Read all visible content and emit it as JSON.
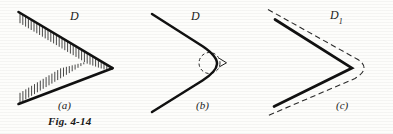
{
  "figure": {
    "caption": "Fig. 4-14",
    "panels": [
      {
        "id": "a",
        "label": "(a)",
        "region_label": "D",
        "description": "wedge domain with hatched boundary"
      },
      {
        "id": "b",
        "label": "(b)",
        "region_label": "D",
        "description": "wedge domain with rounded vertex, dashed circle and arrow"
      },
      {
        "id": "c",
        "label": "(c)",
        "region_label": "D",
        "region_label_subscript": "1",
        "description": "wedge with dashed offset outline"
      }
    ]
  },
  "colors": {
    "ink": "#111111",
    "hatch": "#1b1b1b",
    "dashed": "#2a2a2a",
    "paper": "#fdfdfb"
  }
}
